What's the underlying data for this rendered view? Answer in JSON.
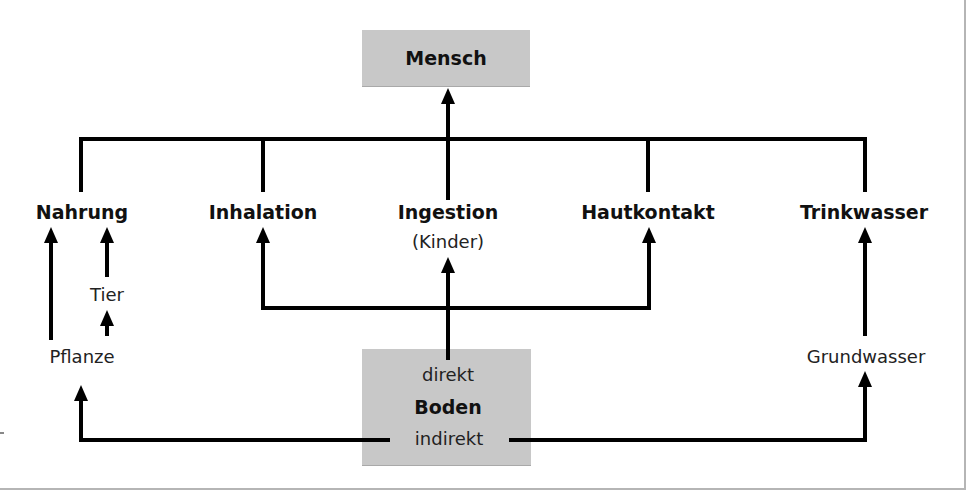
{
  "diagram": {
    "type": "flow",
    "top_node": {
      "label": "Mensch"
    },
    "pathways": [
      {
        "id": "nahrung",
        "label": "Nahrung"
      },
      {
        "id": "inhalation",
        "label": "Inhalation"
      },
      {
        "id": "ingestion",
        "label": "Ingestion",
        "sublabel": "(Kinder)"
      },
      {
        "id": "hautkontakt",
        "label": "Hautkontakt"
      },
      {
        "id": "trinkwasser",
        "label": "Trinkwasser"
      }
    ],
    "intermediates": {
      "tier": "Tier",
      "pflanze": "Pflanze",
      "grundwasser": "Grundwasser"
    },
    "source_node": {
      "label": "Boden",
      "direct_label": "direkt",
      "indirect_label": "indirekt"
    },
    "edges": [
      {
        "from": "Boden (direkt)",
        "to": "Ingestion"
      },
      {
        "from": "Boden (direkt)",
        "to": "Inhalation"
      },
      {
        "from": "Boden (direkt)",
        "to": "Hautkontakt"
      },
      {
        "from": "Boden (indirekt)",
        "to": "Pflanze"
      },
      {
        "from": "Boden (indirekt)",
        "to": "Grundwasser"
      },
      {
        "from": "Pflanze",
        "to": "Nahrung"
      },
      {
        "from": "Pflanze",
        "to": "Tier"
      },
      {
        "from": "Tier",
        "to": "Nahrung"
      },
      {
        "from": "Grundwasser",
        "to": "Trinkwasser"
      },
      {
        "from": "Nahrung",
        "to": "Mensch"
      },
      {
        "from": "Inhalation",
        "to": "Mensch"
      },
      {
        "from": "Ingestion",
        "to": "Mensch"
      },
      {
        "from": "Hautkontakt",
        "to": "Mensch"
      },
      {
        "from": "Trinkwasser",
        "to": "Mensch"
      }
    ],
    "colors": {
      "box_fill": "#c8c8c8",
      "line": "#000000",
      "frame": "#b5b5b5"
    }
  }
}
